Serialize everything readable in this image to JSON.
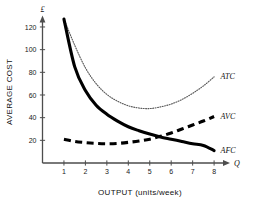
{
  "chart_data": {
    "type": "line",
    "title": "",
    "xlabel": "OUTPUT (units/week)",
    "ylabel": "AVERAGE COST",
    "y_unit_symbol": "£",
    "x_axis_arrow_label": "Q",
    "xlim": [
      0,
      8.6
    ],
    "ylim": [
      0,
      133
    ],
    "grid": false,
    "legend_position": "inline-right-of-curve",
    "x_ticks": [
      1,
      2,
      3,
      4,
      5,
      6,
      7,
      8
    ],
    "y_ticks": [
      20,
      40,
      60,
      80,
      100,
      120
    ],
    "x": [
      1,
      1.5,
      2,
      2.5,
      3,
      3.5,
      4,
      4.5,
      5,
      5.5,
      6,
      6.5,
      7,
      7.5,
      8
    ],
    "series": [
      {
        "name": "AFC",
        "label": "AFC",
        "style": "solid-thick",
        "color": "#000000",
        "values": [
          127,
          85,
          64,
          51,
          43,
          37,
          32,
          28.5,
          25.5,
          23,
          21,
          19,
          17,
          15.5,
          11
        ]
      },
      {
        "name": "AVC",
        "label": "AVC",
        "style": "dashed-thick",
        "color": "#000000",
        "values": [
          21,
          19,
          18,
          17.3,
          17,
          17.3,
          18.2,
          19.4,
          21,
          23.5,
          26.5,
          30,
          33.5,
          37,
          41
        ]
      },
      {
        "name": "ATC",
        "label": "ATC",
        "style": "dotted-thin",
        "color": "#5a5a5a",
        "values": [
          127,
          104,
          84,
          70,
          60.5,
          54.5,
          50.5,
          48.5,
          48,
          49.5,
          52,
          56,
          61.5,
          68,
          76
        ]
      }
    ],
    "annotations": [
      {
        "text": "ATC",
        "x": 8.3,
        "y": 76
      },
      {
        "text": "AVC",
        "x": 8.3,
        "y": 41
      },
      {
        "text": "AFC",
        "x": 8.3,
        "y": 11
      }
    ]
  }
}
